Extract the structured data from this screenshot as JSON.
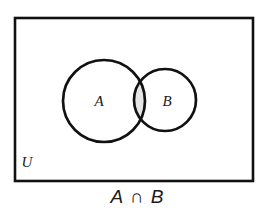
{
  "diagram": {
    "type": "venn-diagram",
    "caption": "A ∩ B",
    "universe_label": "U",
    "set_a_label": "A",
    "set_b_label": "B",
    "shaded_region": "intersection",
    "colors": {
      "stroke": "#111111",
      "background": "#ffffff",
      "shading": "#e6e6e6"
    },
    "geometry": {
      "universe_rect": {
        "x": 15,
        "y": 18,
        "width": 238,
        "height": 163
      },
      "circle_a": {
        "cx": 104,
        "cy": 101,
        "r": 41
      },
      "circle_b": {
        "cx": 165,
        "cy": 100,
        "r": 31
      }
    }
  }
}
